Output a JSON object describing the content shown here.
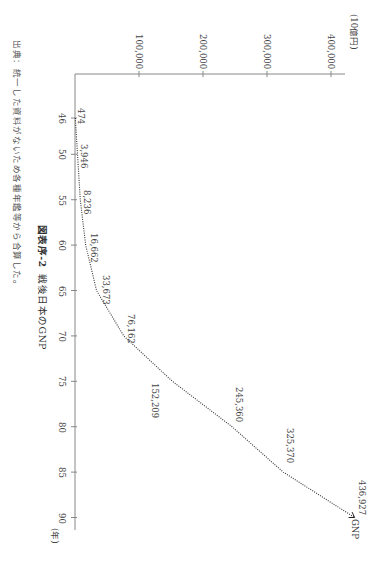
{
  "chart_data": {
    "type": "line",
    "orientation": "rotated 90deg clockwise (x-axis runs top-to-bottom, y-axis runs left-to-right)",
    "title_label": "図表序-2",
    "title": "戦後日本のGNP",
    "xlabel": "(年)",
    "ylabel": "(10億円)",
    "x": [
      46,
      50,
      55,
      60,
      65,
      70,
      75,
      80,
      85,
      90
    ],
    "x_ticks": [
      "46",
      "50",
      "55",
      "60",
      "65",
      "70",
      "75",
      "80",
      "85",
      "90"
    ],
    "y_ticks": [
      "100,000",
      "200,000",
      "300,000",
      "400,000"
    ],
    "ylim": [
      0,
      450000
    ],
    "series": [
      {
        "name": "GNP",
        "values": [
          474,
          3946,
          8236,
          16662,
          33673,
          76162,
          152209,
          245360,
          325370,
          436927
        ],
        "labels": [
          "474",
          "3,946",
          "8,236",
          "16,662",
          "33,673",
          "76,162",
          "152,209",
          "245,360",
          "325,370",
          "436,927"
        ],
        "style": "dotted"
      }
    ],
    "grid": false,
    "legend": "inline label at line end",
    "source_note": "出典：統一した資料がないため各種年鑑等から合算した。"
  },
  "labels": {
    "figure_number": "図表序-2",
    "figure_title": "戦後日本のGNP",
    "unit_y": "(10億円)",
    "unit_x": "(年)",
    "series_name": "GNP",
    "source": "出典：統一した資料がないため各種年鑑等から合算した。"
  }
}
